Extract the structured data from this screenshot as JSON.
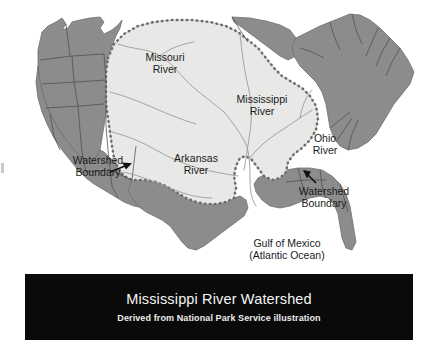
{
  "figure": {
    "kind": "thematic-map"
  },
  "map": {
    "labels": {
      "missouri_river": "Missouri\nRiver",
      "mississippi_river": "Mississippi\nRiver",
      "ohio_river": "Ohio\nRiver",
      "arkansas_river": "Arkansas\nRiver",
      "watershed_boundary_west": "Watershed\nBoundary",
      "watershed_boundary_east": "Watershed\nBoundary",
      "gulf_of_mexico": "Gulf of Mexico\n(Atlantic Ocean)"
    },
    "colors": {
      "land_outside_watershed": "#8c8c8c",
      "watershed_fill": "#e8e8e6",
      "state_border": "#4d4d4d",
      "coast_outline": "#6e6e6e",
      "river_line": "#9b9b9b",
      "boundary_dots": "#6b6b6b",
      "arrow": "#111111",
      "background": "#ffffff"
    }
  },
  "caption": {
    "title": "Mississippi River Watershed",
    "subtitle": "Derived from National Park Service illustration",
    "background": "#0a0a0a",
    "text_color": "#f2f2f2"
  }
}
